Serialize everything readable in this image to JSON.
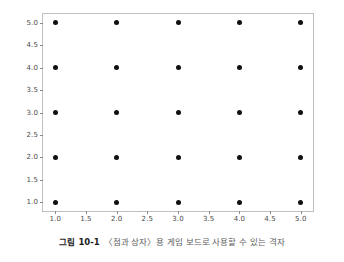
{
  "caption": {
    "label": "그림 10-1",
    "text": "〈점과 상자〉용 게임 보드로 사용할 수 있는 격자"
  },
  "chart_data": {
    "type": "scatter",
    "title": "",
    "xlabel": "",
    "ylabel": "",
    "xlim": [
      0.8,
      5.2
    ],
    "ylim": [
      0.8,
      5.2
    ],
    "grid": false,
    "legend": null,
    "marker": {
      "shape": "circle",
      "color": "#101010",
      "size_px": 5
    },
    "xticks": [
      "1.0",
      "1.5",
      "2.0",
      "2.5",
      "3.0",
      "3.5",
      "4.0",
      "4.5",
      "5.0"
    ],
    "xtick_values": [
      1.0,
      1.5,
      2.0,
      2.5,
      3.0,
      3.5,
      4.0,
      4.5,
      5.0
    ],
    "yticks": [
      "1.0",
      "1.5",
      "2.0",
      "2.5",
      "3.0",
      "3.5",
      "4.0",
      "4.5",
      "5.0"
    ],
    "ytick_values": [
      1.0,
      1.5,
      2.0,
      2.5,
      3.0,
      3.5,
      4.0,
      4.5,
      5.0
    ],
    "x": [
      1,
      2,
      3,
      4,
      5,
      1,
      2,
      3,
      4,
      5,
      1,
      2,
      3,
      4,
      5,
      1,
      2,
      3,
      4,
      5,
      1,
      2,
      3,
      4,
      5
    ],
    "y": [
      1,
      1,
      1,
      1,
      1,
      2,
      2,
      2,
      2,
      2,
      3,
      3,
      3,
      3,
      3,
      4,
      4,
      4,
      4,
      4,
      5,
      5,
      5,
      5,
      5
    ]
  },
  "colors": {
    "marker": "#101010",
    "spine": "#bfbfbf",
    "tick": "#8a8a8a",
    "ticklabel": "#4a4a4a",
    "caption_label": "#1c1c1c",
    "caption_text": "#5d5d5d",
    "background": "#ffffff"
  }
}
